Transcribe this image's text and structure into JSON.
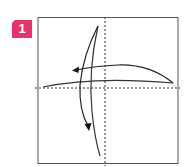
{
  "step": {
    "number": "1",
    "badge_color": "#e8336a"
  },
  "diagram": {
    "paper_color": "#ffffff",
    "outline_color": "#555555",
    "line_color": "#333333",
    "arrow_color": "#111111",
    "fold_lines": [
      "horizontal-valley-fold",
      "vertical-valley-fold"
    ],
    "arrows": [
      "fold-right-to-left",
      "fold-top-to-bottom"
    ]
  }
}
